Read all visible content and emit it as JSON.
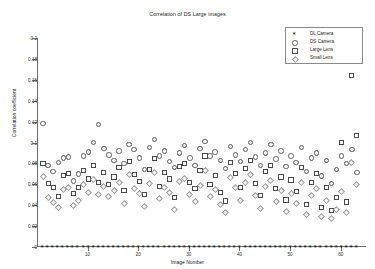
{
  "chart_data": {
    "type": "scatter",
    "title": "Correlation of DS Large images",
    "xlabel": "Image Number",
    "ylabel": "Correlation coefficient",
    "xlim": [
      0,
      65
    ],
    "ylim": [
      0,
      0.2
    ],
    "xticks": [
      0,
      10,
      20,
      30,
      40,
      50,
      60
    ],
    "yticks": [
      0,
      0.02,
      0.04,
      0.06,
      0.08,
      0.1,
      0.12,
      0.14,
      0.16,
      0.18,
      0.2
    ],
    "ytick_labels": [
      "0",
      "0.02",
      "0.04",
      "0.06",
      "0.08",
      "0.1",
      "0.12",
      "0.14",
      "0.16",
      "0.18",
      "0.2"
    ],
    "xtick_labels": [
      "0",
      "10",
      "20",
      "30",
      "40",
      "50",
      "60"
    ],
    "grid": false,
    "legend_position": "top-right",
    "legend_entries": [
      "DL Camera",
      "DS Camera",
      "Large Lens",
      "Small Lens"
    ],
    "series": [
      {
        "name": "DL Camera",
        "marker": "asterisk",
        "color": "#111111",
        "x": [
          1,
          2,
          3,
          4,
          5,
          6,
          7,
          8,
          9,
          10,
          11,
          12,
          13,
          14,
          15,
          16,
          17,
          18,
          19,
          20,
          21,
          22,
          23,
          24,
          25,
          26,
          27,
          28,
          29,
          30,
          31,
          32,
          33,
          34,
          35,
          36,
          37,
          38,
          39,
          40,
          41,
          42,
          43,
          44,
          45,
          46,
          47,
          48,
          49,
          50,
          51,
          52,
          53,
          54,
          55,
          56,
          57,
          58,
          59,
          60,
          61,
          62,
          63
        ],
        "values": [
          0,
          0,
          0,
          0,
          0,
          0,
          0,
          0,
          0,
          0,
          0,
          0,
          0,
          0,
          0,
          0,
          0,
          0,
          0,
          0,
          0,
          0,
          0,
          0,
          0,
          0,
          0,
          0,
          0,
          0,
          0,
          0,
          0,
          0,
          0,
          0,
          0,
          0,
          0,
          0,
          0,
          0,
          0,
          0,
          0,
          0,
          0,
          0,
          0,
          0,
          0,
          0,
          0,
          0,
          0,
          0,
          0,
          0,
          0,
          0,
          0,
          0,
          0
        ]
      },
      {
        "name": "DS Camera",
        "marker": "circle",
        "color": "#5b5b5b",
        "x": [
          1,
          2,
          3,
          4,
          5,
          6,
          7,
          8,
          9,
          10,
          11,
          12,
          13,
          14,
          15,
          16,
          17,
          18,
          19,
          20,
          21,
          22,
          23,
          24,
          25,
          26,
          27,
          28,
          29,
          30,
          31,
          32,
          33,
          34,
          35,
          36,
          37,
          38,
          39,
          40,
          41,
          42,
          43,
          44,
          45,
          46,
          47,
          48,
          49,
          50,
          51,
          52,
          53,
          54,
          55,
          56,
          57,
          58,
          59,
          60,
          61,
          62,
          63
        ],
        "values": [
          0.119,
          0.079,
          0.073,
          0.082,
          0.086,
          0.087,
          0.064,
          0.071,
          0.088,
          0.092,
          0.101,
          0.118,
          0.095,
          0.089,
          0.084,
          0.093,
          0.081,
          0.099,
          0.094,
          0.086,
          0.075,
          0.096,
          0.104,
          0.088,
          0.093,
          0.083,
          0.077,
          0.091,
          0.098,
          0.086,
          0.079,
          0.095,
          0.102,
          0.088,
          0.092,
          0.084,
          0.076,
          0.097,
          0.089,
          0.083,
          0.094,
          0.101,
          0.087,
          0.079,
          0.091,
          0.099,
          0.085,
          0.093,
          0.078,
          0.088,
          0.082,
          0.096,
          0.073,
          0.086,
          0.091,
          0.069,
          0.084,
          0.062,
          0.075,
          0.088,
          0.081,
          0.094,
          0.072
        ]
      },
      {
        "name": "Large Lens",
        "marker": "square",
        "color": "#4a4a4a",
        "x": [
          1,
          2,
          3,
          4,
          5,
          6,
          7,
          8,
          9,
          10,
          11,
          12,
          13,
          14,
          15,
          16,
          17,
          18,
          19,
          20,
          21,
          22,
          23,
          24,
          25,
          26,
          27,
          28,
          29,
          30,
          31,
          32,
          33,
          34,
          35,
          36,
          37,
          38,
          39,
          40,
          41,
          42,
          43,
          44,
          45,
          46,
          47,
          48,
          49,
          50,
          51,
          52,
          53,
          54,
          55,
          56,
          57,
          58,
          59,
          60,
          61,
          62,
          63
        ],
        "values": [
          0.081,
          0.062,
          0.058,
          0.049,
          0.069,
          0.071,
          0.052,
          0.058,
          0.074,
          0.066,
          0.079,
          0.063,
          0.072,
          0.061,
          0.068,
          0.077,
          0.055,
          0.083,
          0.07,
          0.064,
          0.051,
          0.075,
          0.086,
          0.059,
          0.072,
          0.066,
          0.048,
          0.078,
          0.081,
          0.063,
          0.057,
          0.074,
          0.088,
          0.061,
          0.069,
          0.053,
          0.045,
          0.082,
          0.071,
          0.058,
          0.076,
          0.084,
          0.062,
          0.05,
          0.073,
          0.079,
          0.057,
          0.068,
          0.046,
          0.065,
          0.054,
          0.077,
          0.042,
          0.063,
          0.071,
          0.039,
          0.058,
          0.036,
          0.048,
          0.101,
          0.044,
          0.165,
          0.108
        ]
      },
      {
        "name": "Small Lens",
        "marker": "diamond",
        "color": "#9a9a9a",
        "x": [
          1,
          2,
          3,
          4,
          5,
          6,
          7,
          8,
          9,
          10,
          11,
          12,
          13,
          14,
          15,
          16,
          17,
          18,
          19,
          20,
          21,
          22,
          23,
          24,
          25,
          26,
          27,
          28,
          29,
          30,
          31,
          32,
          33,
          34,
          35,
          36,
          37,
          38,
          39,
          40,
          41,
          42,
          43,
          44,
          45,
          46,
          47,
          48,
          49,
          50,
          51,
          52,
          53,
          54,
          55,
          56,
          57,
          58,
          59,
          60,
          61,
          62,
          63
        ],
        "values": [
          0.069,
          0.048,
          0.044,
          0.039,
          0.056,
          0.058,
          0.041,
          0.046,
          0.061,
          0.053,
          0.066,
          0.051,
          0.059,
          0.049,
          0.055,
          0.063,
          0.043,
          0.07,
          0.057,
          0.052,
          0.04,
          0.062,
          0.072,
          0.047,
          0.058,
          0.053,
          0.037,
          0.064,
          0.067,
          0.051,
          0.045,
          0.06,
          0.074,
          0.049,
          0.056,
          0.042,
          0.034,
          0.068,
          0.058,
          0.046,
          0.063,
          0.07,
          0.05,
          0.038,
          0.059,
          0.065,
          0.045,
          0.055,
          0.035,
          0.052,
          0.043,
          0.063,
          0.032,
          0.05,
          0.057,
          0.03,
          0.046,
          0.028,
          0.037,
          0.054,
          0.034,
          0.082,
          0.061
        ]
      }
    ]
  }
}
